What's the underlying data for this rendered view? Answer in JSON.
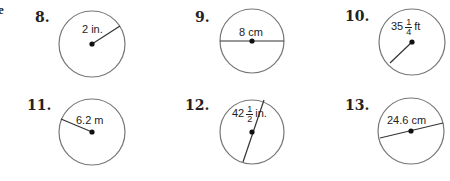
{
  "page": {
    "edge_fragment": "e",
    "problems": [
      {
        "number": "8.",
        "label": "2 in.",
        "segment": "radius"
      },
      {
        "number": "9.",
        "label": "8 cm",
        "segment": "diameter"
      },
      {
        "number": "10.",
        "label_whole": "35",
        "label_num": "1",
        "label_den": "4",
        "label_unit": "ft",
        "segment": "radius"
      },
      {
        "number": "11.",
        "label": "6.2 m",
        "segment": "radius"
      },
      {
        "number": "12.",
        "label_whole": "42",
        "label_num": "1",
        "label_den": "2",
        "label_unit": "in.",
        "segment": "diameter"
      },
      {
        "number": "13.",
        "label": "24.6 cm",
        "segment": "diameter"
      }
    ]
  }
}
